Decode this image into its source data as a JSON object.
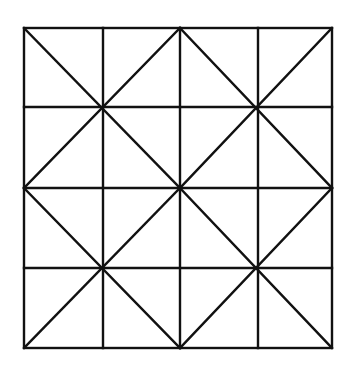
{
  "diagram": {
    "type": "geometric-grid",
    "stroke_color": "#111111",
    "background_color": "#ffffff",
    "outer_square": {
      "x1": 24,
      "y1": 28,
      "x2": 332,
      "y2": 348
    },
    "grid": {
      "rows": 4,
      "cols": 4,
      "vertical_lines_x": [
        103,
        180,
        258
      ],
      "horizontal_lines_y": [
        107,
        188,
        268
      ]
    },
    "quadrants": [
      {
        "name": "top-left",
        "x1": 24,
        "y1": 28,
        "x2": 180,
        "y2": 188
      },
      {
        "name": "top-right",
        "x1": 180,
        "y1": 28,
        "x2": 332,
        "y2": 188
      },
      {
        "name": "bottom-left",
        "x1": 24,
        "y1": 188,
        "x2": 180,
        "y2": 348
      },
      {
        "name": "bottom-right",
        "x1": 180,
        "y1": 188,
        "x2": 332,
        "y2": 348
      }
    ]
  }
}
